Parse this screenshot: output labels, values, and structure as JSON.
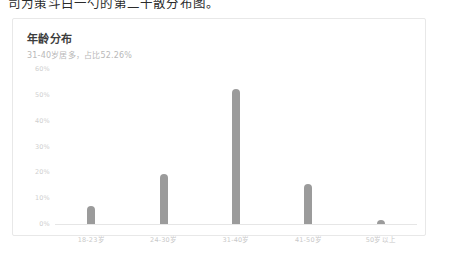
{
  "page": {
    "cut_off_line": "司为策斗白一勺的第二十散分布图。"
  },
  "card": {
    "title": "年龄分布",
    "subtitle": "31-40岁居多，占比52.26%"
  },
  "chart_data": {
    "type": "bar",
    "title": "年龄分布",
    "subtitle": "31-40岁居多，占比52.26%",
    "categories": [
      "18-23岁",
      "24-30岁",
      "31-40岁",
      "41-50岁",
      "50岁以上"
    ],
    "values": [
      7.1,
      19.4,
      52.26,
      15.5,
      1.6
    ],
    "value_labels": [
      "7.1%",
      "19.4%",
      "52.26%",
      "15.5%",
      "1.6%"
    ],
    "xlabel": "",
    "ylabel": "",
    "ylim": [
      0,
      60
    ],
    "yticks": [
      60,
      50,
      40,
      30,
      20,
      10,
      0
    ],
    "ytick_labels": [
      "60%",
      "50%",
      "40%",
      "30%",
      "20%",
      "10%",
      "0%"
    ],
    "grid": false,
    "legend": null,
    "series_color": "#9b9b9b"
  }
}
